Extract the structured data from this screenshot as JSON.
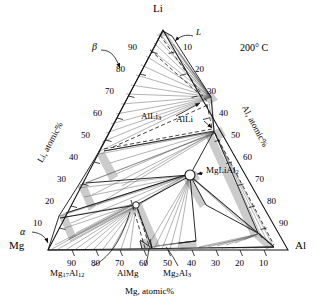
{
  "diagram": {
    "type": "ternary-phase-diagram",
    "temperature_label": "200° C"
  },
  "corners": {
    "top": "Li",
    "bottom_left": "Mg",
    "bottom_right": "Al"
  },
  "axes": {
    "left": {
      "name_a": "Li, atomic",
      "name_b": "%",
      "ticks": [
        10,
        20,
        30,
        40,
        50,
        60,
        70,
        80,
        90
      ]
    },
    "right": {
      "name_a": "Al, atomic",
      "name_b": "%",
      "ticks": [
        10,
        20,
        30,
        40,
        50,
        60,
        70,
        80,
        90
      ]
    },
    "bottom": {
      "name_a": "Mg, atomic",
      "name_b": "%",
      "ticks": [
        90,
        80,
        70,
        60,
        50,
        40,
        30,
        20,
        10
      ]
    }
  },
  "phases": [
    {
      "id": "liquid",
      "label": "L",
      "sub": "",
      "x": 196,
      "y": 33
    },
    {
      "id": "beta",
      "label": "β",
      "sub": "",
      "x": 94,
      "y": 47
    },
    {
      "id": "alpha",
      "label": "α",
      "sub": "",
      "x": 22,
      "y": 232
    },
    {
      "id": "allithree",
      "label": "AlLi",
      "sub": "3",
      "x": 157,
      "y": 116
    },
    {
      "id": "alli",
      "label": "AlLi",
      "sub": "",
      "x": 186,
      "y": 120
    },
    {
      "id": "mglial2",
      "label": "MgLiAl",
      "sub": "2",
      "x": 206,
      "y": 171
    },
    {
      "id": "mg17al12",
      "label": "Mg",
      "sub": "17",
      "label2": "Al",
      "sub2": "12",
      "x": 57,
      "y": 272
    },
    {
      "id": "almg",
      "label": "AlMg",
      "sub": "",
      "x": 119,
      "y": 272
    },
    {
      "id": "mg2al3",
      "label": "Mg",
      "sub": "2",
      "label2": "Al",
      "sub2": "3",
      "x": 168,
      "y": 272
    }
  ],
  "colors": {
    "line": "#1a1a1a",
    "tieline": "#5a5a5a",
    "twophase_fill": "#c8c8c8",
    "background": "#ffffff"
  },
  "geometry": {
    "apex_li": [
      163,
      30
    ],
    "corner_mg": [
      48,
      250
    ],
    "corner_al": [
      288,
      250
    ]
  }
}
